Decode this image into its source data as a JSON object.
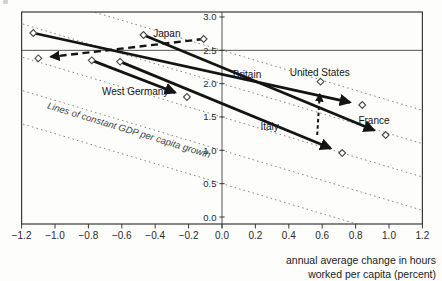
{
  "chart_data": {
    "type": "scatter",
    "title": "",
    "xlabel_lines": [
      "annual average change in hours",
      "worked per capita (percent)"
    ],
    "ylabel": "",
    "x_range": [
      -1.2,
      1.2
    ],
    "y_range": [
      -0.105,
      3.075
    ],
    "x_ticks": [
      -1.2,
      -1.0,
      -0.8,
      -0.6,
      -0.4,
      -0.2,
      0.0,
      0.2,
      0.4,
      0.6,
      0.8,
      1.0,
      1.2
    ],
    "x_tick_labels": [
      "−1.2",
      "−1.0",
      "−0.8",
      "−0.6",
      "−0.4",
      "−0.2",
      "0.0",
      "0.2",
      "0.4",
      "0.6",
      "0.8",
      "1.0",
      "1.2"
    ],
    "y_ticks": [
      0.0,
      0.5,
      1.0,
      1.5,
      2.0,
      2.5,
      3.0
    ],
    "y_tick_labels": [
      "0.0",
      "0.5",
      "1.0",
      "1.5",
      "2.0",
      "2.5",
      "3.0"
    ],
    "grid": false,
    "reference_lines": {
      "vertical_x": 0.0,
      "horizontal_y": 2.5
    },
    "constant_gdp_lines": {
      "label": "Lines of constant GDP per capita growth",
      "slope": -0.75,
      "intercepts_at_x0": [
        0.5,
        1.0,
        1.5,
        2.0,
        2.5
      ],
      "label_anchor": [
        -1.05,
        1.63
      ],
      "label_angle_deg": 17
    },
    "series": [
      {
        "name": "Britain",
        "from": [
          -1.13,
          2.76
        ],
        "to": [
          0.84,
          1.68
        ],
        "style": "solid",
        "arrow_at": "to",
        "diamonds": [
          "from",
          "to"
        ],
        "label_pos": [
          0.15,
          2.135
        ],
        "label_align": "middle"
      },
      {
        "name": "France",
        "from": [
          -0.47,
          2.73
        ],
        "to": [
          0.98,
          1.23
        ],
        "style": "solid",
        "arrow_at": "to",
        "diamonds": [
          "from",
          "to"
        ],
        "label_pos": [
          0.91,
          1.44
        ],
        "label_align": "middle"
      },
      {
        "name": "Italy",
        "from": [
          -0.61,
          2.33
        ],
        "to": [
          0.72,
          0.96
        ],
        "style": "solid",
        "arrow_at": "to",
        "diamonds": [
          "from",
          "to"
        ],
        "label_pos": [
          0.285,
          1.355
        ],
        "label_align": "middle"
      },
      {
        "name": "West Germany",
        "from": [
          -0.78,
          2.35
        ],
        "to": [
          -0.21,
          1.8
        ],
        "style": "solid",
        "arrow_at": "to",
        "diamonds": [
          "from",
          "to"
        ],
        "label_pos": [
          -0.52,
          1.885
        ],
        "label_align": "middle"
      },
      {
        "name": "Japan",
        "from": [
          -0.11,
          2.67
        ],
        "to": [
          -1.1,
          2.38
        ],
        "style": "dashed-bold",
        "arrow_at": "to",
        "diamonds": [
          "from",
          "to"
        ],
        "label_pos": [
          -0.33,
          2.745
        ],
        "label_align": "middle"
      },
      {
        "name": "United States",
        "from": [
          0.57,
          1.23
        ],
        "to": [
          0.59,
          2.03
        ],
        "style": "dashed-fine",
        "arrow_at": "to",
        "diamonds": [
          "to"
        ],
        "label_pos": [
          0.585,
          2.17
        ],
        "label_align": "middle"
      }
    ],
    "colors": {
      "arrow": "#141414",
      "frame": "#3a3a3a",
      "ref_line": "#555555",
      "dotted_line": "#8a8a8a",
      "diamond_fill": "#ffffff",
      "diamond_stroke": "#4a4a4a",
      "text": "#1d1d1d"
    },
    "layout_px": {
      "x0_px": 222,
      "px_per_x": 167,
      "y0_px": 217,
      "px_per_y": 66.667,
      "frame": {
        "left": 21.6,
        "top": 12,
        "right": 422.4,
        "bottom": 224
      }
    }
  }
}
